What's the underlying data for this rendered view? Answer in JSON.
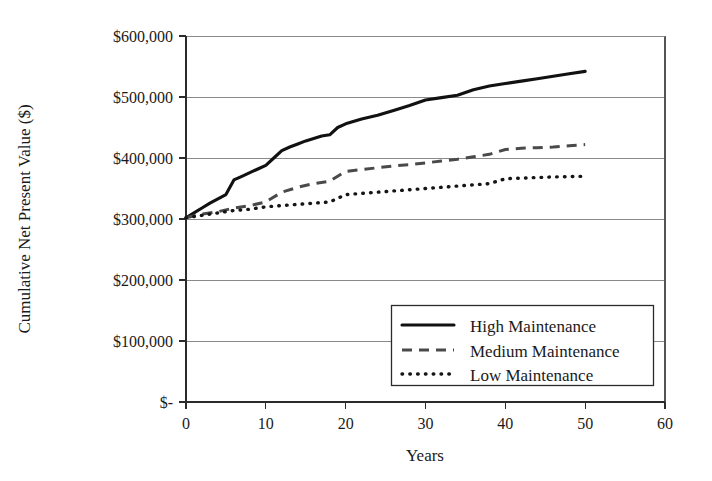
{
  "chart_data": {
    "type": "line",
    "title": "",
    "xlabel": "Years",
    "ylabel": "Cumulative Net Present Value ($)",
    "xlim": [
      0,
      60
    ],
    "ylim": [
      0,
      600000
    ],
    "grid": true,
    "legend_position": "bottom-right",
    "xticks": [
      0,
      10,
      20,
      30,
      40,
      50,
      60
    ],
    "xtick_labels": [
      "0",
      "10",
      "20",
      "30",
      "40",
      "50",
      "60"
    ],
    "yticks": [
      0,
      100000,
      200000,
      300000,
      400000,
      500000,
      600000
    ],
    "ytick_labels": [
      "$-",
      "$100,000",
      "$200,000",
      "$300,000",
      "$400,000",
      "$500,000",
      "$600,000"
    ],
    "series": [
      {
        "name": "High Maintenance",
        "style": "solid",
        "color": "#111111",
        "x": [
          0,
          1,
          2,
          3,
          4,
          5,
          6,
          7,
          8,
          9,
          10,
          11,
          12,
          13,
          14,
          15,
          16,
          17,
          18,
          19,
          20,
          22,
          24,
          26,
          28,
          30,
          32,
          34,
          36,
          38,
          40,
          42,
          44,
          46,
          48,
          50
        ],
        "y": [
          302000,
          310000,
          318000,
          326000,
          333000,
          340000,
          364000,
          370000,
          376000,
          382000,
          388000,
          400000,
          412000,
          418000,
          423000,
          428000,
          432000,
          436000,
          438000,
          450000,
          456000,
          464000,
          470000,
          478000,
          486000,
          495000,
          499000,
          503000,
          512000,
          518000,
          522000,
          526000,
          530000,
          534000,
          538000,
          542000
        ]
      },
      {
        "name": "Medium Maintenance",
        "style": "dashed",
        "color": "#4a4a4a",
        "x": [
          0,
          2,
          4,
          6,
          8,
          10,
          12,
          14,
          16,
          18,
          20,
          22,
          24,
          26,
          28,
          30,
          32,
          34,
          36,
          38,
          40,
          42,
          44,
          46,
          48,
          50
        ],
        "y": [
          302000,
          308000,
          312000,
          318000,
          322000,
          328000,
          344000,
          352000,
          358000,
          362000,
          378000,
          381000,
          384000,
          387000,
          389000,
          392000,
          395000,
          398000,
          402000,
          406000,
          414000,
          416000,
          417000,
          418000,
          420000,
          422000
        ]
      },
      {
        "name": "Low Maintenance",
        "style": "dotted",
        "color": "#151515",
        "x": [
          0,
          2,
          4,
          6,
          8,
          10,
          12,
          14,
          16,
          18,
          20,
          22,
          24,
          26,
          28,
          30,
          32,
          34,
          36,
          38,
          40,
          42,
          44,
          46,
          48,
          50
        ],
        "y": [
          302000,
          306000,
          310000,
          314000,
          316000,
          320000,
          322000,
          324000,
          326000,
          328000,
          340000,
          342000,
          344000,
          346000,
          348000,
          350000,
          352000,
          354000,
          356000,
          358000,
          366000,
          367000,
          368000,
          369000,
          369500,
          370000
        ]
      }
    ],
    "legend_entries": [
      {
        "label": "High Maintenance",
        "style": "solid"
      },
      {
        "label": "Medium Maintenance",
        "style": "dashed"
      },
      {
        "label": "Low Maintenance",
        "style": "dotted"
      }
    ]
  }
}
